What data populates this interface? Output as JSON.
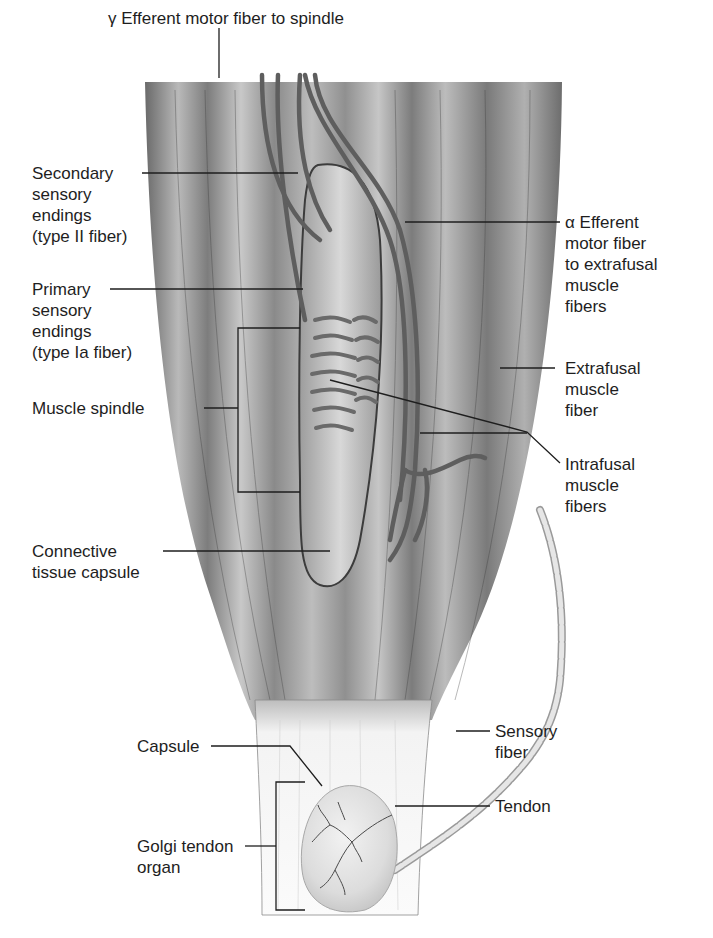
{
  "figure": {
    "colors": {
      "muscle_dark": "#5a5a5a",
      "muscle_mid": "#8a8a8a",
      "muscle_light": "#d0d0d0",
      "tendon": "#f1f1f1",
      "capsule_fill": "#e4e4e4",
      "nerve": "#6b6b6b",
      "leader_line": "#1e1e1e"
    },
    "labels": {
      "gamma_efferent": "γ Efferent motor fiber to spindle",
      "secondary_endings": "Secondary\nsensory\nendings\n(type II fiber)",
      "primary_endings": "Primary\nsensory\nendings\n(type Ia fiber)",
      "muscle_spindle": "Muscle spindle",
      "connective_capsule": "Connective\ntissue capsule",
      "alpha_efferent": "α Efferent\nmotor fiber\nto extrafusal\nmuscle\nfibers",
      "extrafusal": "Extrafusal\nmuscle\nfiber",
      "intrafusal": "Intrafusal\nmuscle\nfibers",
      "sensory_fiber": "Sensory\nfiber",
      "tendon": "Tendon",
      "capsule": "Capsule",
      "golgi_tendon_organ": "Golgi tendon\norgan"
    }
  }
}
